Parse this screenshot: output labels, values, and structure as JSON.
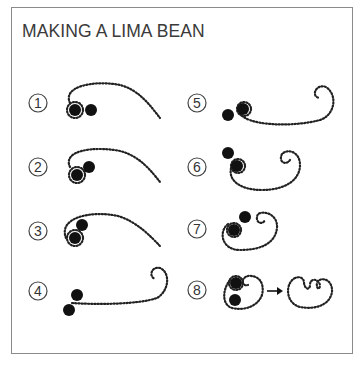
{
  "title": "MAKING A LIMA BEAN",
  "steps": [
    {
      "number": "1",
      "label": "1"
    },
    {
      "number": "2",
      "label": "2"
    },
    {
      "number": "3",
      "label": "3"
    },
    {
      "number": "4",
      "label": "4"
    },
    {
      "number": "5",
      "label": "5"
    },
    {
      "number": "6",
      "label": "6"
    },
    {
      "number": "7",
      "label": "7"
    },
    {
      "number": "8",
      "label": "8"
    }
  ],
  "colors": {
    "ink": "#111111",
    "frame": "#8a8a8a",
    "text": "#3a3a3a"
  }
}
